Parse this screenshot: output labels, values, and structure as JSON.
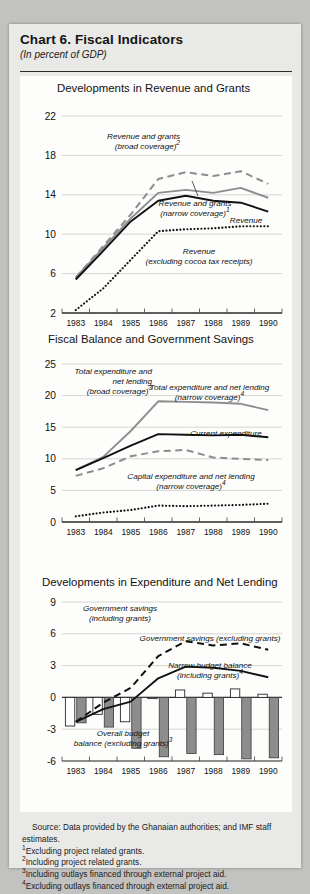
{
  "header": {
    "title": "Chart 6.  Fiscal Indicators",
    "subtitle": "(In percent of GDP)"
  },
  "footnotes": {
    "source": "Source: Data provided by the Ghanaian authorities; and  IMF staff estimates.",
    "items": [
      {
        "marker": "1",
        "text": "Excluding project related grants."
      },
      {
        "marker": "2",
        "text": "Including project related grants."
      },
      {
        "marker": "3",
        "text": "Including outlays financed through external project aid."
      },
      {
        "marker": "4",
        "text": "Excluding outlays financed through external project aid."
      }
    ]
  },
  "colors": {
    "black_line": "#111111",
    "gray_line": "#8d8d8d",
    "bar_white": "#ffffff",
    "bar_gray": "#8d8d8d",
    "grid": "#d5d5d3",
    "paper": "#e9e9e7",
    "plot_bg": "#fdfdfc"
  },
  "chart_data": [
    {
      "type": "line",
      "id": "panel-1",
      "title": "Developments in Revenue and Grants",
      "xlabel": "",
      "ylabel": "",
      "x": [
        "1983",
        "1984",
        "1985",
        "1986",
        "1987",
        "1988",
        "1989",
        "1990"
      ],
      "ylim": [
        2,
        22
      ],
      "yticks": [
        2,
        6,
        10,
        14,
        18,
        22
      ],
      "grid": true,
      "legend": "inline-annotations",
      "series": [
        {
          "name": "Revenue and grants (broad coverage)",
          "footnote": "2",
          "style": "dashed",
          "color": "#8d8d8d",
          "values": [
            5.6,
            8.8,
            12.0,
            15.6,
            16.3,
            15.9,
            16.4,
            15.1
          ],
          "label_lines": [
            "Revenue and grants",
            "(broad coverage)"
          ],
          "label_sup": "2"
        },
        {
          "name": "Revenue and grants (narrow coverage)",
          "footnote": "1",
          "style": "solid",
          "color": "#8d8d8d",
          "values": [
            5.6,
            8.6,
            11.6,
            14.2,
            14.5,
            14.2,
            14.7,
            13.7
          ],
          "label_lines": [
            "Revenue and grants",
            "(narrow coverage)"
          ],
          "label_sup": "1"
        },
        {
          "name": "Revenue",
          "style": "solid",
          "color": "#111111",
          "values": [
            5.4,
            8.3,
            11.3,
            13.4,
            13.9,
            13.4,
            13.2,
            12.3
          ],
          "label_lines": [
            "Revenue"
          ],
          "label_sup": ""
        },
        {
          "name": "Revenue (excluding cocoa tax receipts)",
          "style": "dotted",
          "color": "#111111",
          "values": [
            2.3,
            4.5,
            7.4,
            10.3,
            10.5,
            10.6,
            10.8,
            10.8
          ],
          "label_lines": [
            "Revenue",
            "(excluding  cocoa tax receipts)"
          ],
          "label_sup": ""
        }
      ]
    },
    {
      "type": "line",
      "id": "panel-2",
      "title": "Fiscal Balance and Government Savings",
      "xlabel": "",
      "ylabel": "",
      "x": [
        "1983",
        "1984",
        "1985",
        "1986",
        "1987",
        "1988",
        "1989",
        "1990"
      ],
      "ylim": [
        0,
        25
      ],
      "yticks": [
        0,
        5,
        10,
        15,
        20,
        25
      ],
      "grid": true,
      "legend": "inline-annotations",
      "series": [
        {
          "name": "Total expenditure and net lending (broad coverage)",
          "footnote": "3",
          "style": "solid",
          "color": "#8d8d8d",
          "values": [
            8.2,
            10.3,
            14.4,
            19.1,
            19.0,
            18.9,
            18.7,
            17.7
          ],
          "label_lines": [
            "Total expenditure and",
            "net lending",
            "(broad coverage)"
          ],
          "label_sup": "3"
        },
        {
          "name": "Total expenditure and net lending (narrow coverage)",
          "footnote": "4",
          "style": "solid",
          "color": "#111111",
          "values": [
            8.2,
            10.1,
            12.1,
            13.9,
            13.8,
            13.7,
            13.8,
            13.4
          ],
          "label_lines": [
            "Total expenditure and net lending",
            "(narrow coverage)"
          ],
          "label_sup": "4"
        },
        {
          "name": "Current expenditure",
          "style": "dashed",
          "color": "#8d8d8d",
          "values": [
            7.3,
            8.5,
            10.4,
            11.2,
            11.4,
            10.2,
            10.0,
            9.8
          ],
          "label_lines": [
            "Current expenditure"
          ],
          "label_sup": ""
        },
        {
          "name": "Capital expenditure and net lending (narrow coverage)",
          "footnote": "4",
          "style": "dotted",
          "color": "#111111",
          "values": [
            0.9,
            1.5,
            1.9,
            2.6,
            2.5,
            2.6,
            2.7,
            2.9
          ],
          "label_lines": [
            "Capital expenditure and net lending",
            "(narrow coverage)"
          ],
          "label_sup": "4"
        }
      ]
    },
    {
      "type": "bar",
      "id": "panel-3",
      "title": "Developments in Expenditure and Net Lending",
      "xlabel": "",
      "ylabel": "",
      "x": [
        "1983",
        "1984",
        "1985",
        "1986",
        "1987",
        "1988",
        "1989",
        "1990"
      ],
      "ylim": [
        -6,
        9
      ],
      "yticks": [
        -6,
        -3,
        0,
        3,
        6,
        9
      ],
      "grid": true,
      "legend": "inline-annotations",
      "bar_series": [
        {
          "name": "Narrow budget balance (including grants)",
          "footnote": "4",
          "fill": "#ffffff",
          "values": [
            -2.7,
            -1.6,
            -2.3,
            -0.1,
            0.7,
            0.4,
            0.8,
            0.3
          ],
          "label_lines": [
            "Narrow budget balance",
            "(including grants)"
          ],
          "label_sup": "4"
        },
        {
          "name": "Overall budget balance (excluding grants)",
          "footnote": "3",
          "fill": "#8d8d8d",
          "values": [
            -2.4,
            -2.8,
            -4.8,
            -5.6,
            -5.3,
            -5.4,
            -5.8,
            -5.7
          ],
          "label_lines": [
            "Overall budget",
            "balance (excluding grants)"
          ],
          "label_sup": "3"
        }
      ],
      "series": [
        {
          "name": "Government savings (including grants)",
          "style": "dashed",
          "color": "#111111",
          "values": [
            -2.3,
            -0.5,
            0.9,
            3.9,
            5.3,
            4.9,
            5.1,
            4.5
          ],
          "label_lines": [
            "Government savings",
            "(including grants)"
          ],
          "label_sup": ""
        },
        {
          "name": "Government savings (excluding grants)",
          "style": "solid",
          "color": "#111111",
          "values": [
            -2.3,
            -1.1,
            -0.4,
            1.8,
            2.9,
            2.8,
            2.5,
            1.9
          ],
          "label_lines": [
            "Government savings (excluding grants)"
          ],
          "label_sup": ""
        }
      ]
    }
  ]
}
